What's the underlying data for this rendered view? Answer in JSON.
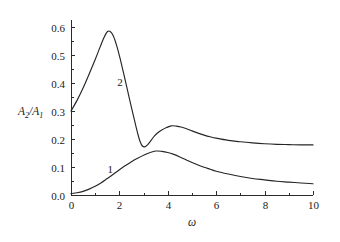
{
  "chart_data": {
    "type": "line",
    "title": "",
    "xlabel": "ω",
    "ylabel": "A2/A1",
    "ylabel_parts": {
      "base1": "A",
      "sub1": "2",
      "slash": "/",
      "base2": "A",
      "sub2": "1"
    },
    "xlim": [
      0,
      10
    ],
    "ylim": [
      0.0,
      0.6
    ],
    "grid": false,
    "legend": "none",
    "x_ticks_major": [
      0,
      2,
      4,
      6,
      8,
      10
    ],
    "x_tick_labels": [
      "0",
      "2",
      "4",
      "6",
      "8",
      "10"
    ],
    "x_ticks_minor": [
      1,
      3,
      5,
      7,
      9
    ],
    "y_ticks_major": [
      0.0,
      0.1,
      0.2,
      0.3,
      0.4,
      0.5,
      0.6
    ],
    "y_tick_labels": [
      "0.0",
      "0.1",
      "0.2",
      "0.3",
      "0.4",
      "0.5",
      "0.6"
    ],
    "y_ticks_minor": [
      0.05,
      0.15,
      0.25,
      0.35,
      0.45,
      0.55
    ],
    "tick_direction": "in",
    "spines": [
      "left",
      "bottom"
    ],
    "annotations": [
      {
        "text": "1",
        "x": 1.62,
        "y": 0.093
      },
      {
        "text": "2",
        "x": 2.02,
        "y": 0.402
      }
    ],
    "series": [
      {
        "name": "1",
        "label": "1",
        "color": "#262626",
        "points": [
          [
            0.0,
            0.005
          ],
          [
            0.25,
            0.008
          ],
          [
            0.5,
            0.013
          ],
          [
            0.75,
            0.021
          ],
          [
            1.0,
            0.031
          ],
          [
            1.25,
            0.044
          ],
          [
            1.5,
            0.059
          ],
          [
            1.75,
            0.074
          ],
          [
            2.0,
            0.09
          ],
          [
            2.25,
            0.105
          ],
          [
            2.5,
            0.119
          ],
          [
            2.75,
            0.131
          ],
          [
            3.0,
            0.142
          ],
          [
            3.25,
            0.151
          ],
          [
            3.5,
            0.157
          ],
          [
            3.75,
            0.156
          ],
          [
            4.0,
            0.152
          ],
          [
            4.25,
            0.145
          ],
          [
            4.5,
            0.136
          ],
          [
            4.75,
            0.126
          ],
          [
            5.0,
            0.116
          ],
          [
            5.25,
            0.107
          ],
          [
            5.5,
            0.099
          ],
          [
            5.75,
            0.092
          ],
          [
            6.0,
            0.085
          ],
          [
            6.5,
            0.075
          ],
          [
            7.0,
            0.066
          ],
          [
            7.5,
            0.059
          ],
          [
            8.0,
            0.054
          ],
          [
            8.5,
            0.049
          ],
          [
            9.0,
            0.046
          ],
          [
            9.5,
            0.043
          ],
          [
            10.0,
            0.04
          ]
        ]
      },
      {
        "name": "2",
        "label": "2",
        "color": "#262626",
        "points": [
          [
            0.0,
            0.3
          ],
          [
            0.25,
            0.338
          ],
          [
            0.5,
            0.382
          ],
          [
            0.75,
            0.432
          ],
          [
            1.0,
            0.484
          ],
          [
            1.2,
            0.528
          ],
          [
            1.35,
            0.56
          ],
          [
            1.5,
            0.583
          ],
          [
            1.62,
            0.584
          ],
          [
            1.75,
            0.568
          ],
          [
            1.9,
            0.53
          ],
          [
            2.05,
            0.48
          ],
          [
            2.2,
            0.425
          ],
          [
            2.35,
            0.368
          ],
          [
            2.5,
            0.312
          ],
          [
            2.62,
            0.268
          ],
          [
            2.75,
            0.222
          ],
          [
            2.85,
            0.192
          ],
          [
            2.95,
            0.175
          ],
          [
            3.05,
            0.172
          ],
          [
            3.15,
            0.178
          ],
          [
            3.3,
            0.194
          ],
          [
            3.45,
            0.211
          ],
          [
            3.6,
            0.223
          ],
          [
            3.75,
            0.232
          ],
          [
            3.95,
            0.241
          ],
          [
            4.15,
            0.247
          ],
          [
            4.35,
            0.246
          ],
          [
            4.55,
            0.243
          ],
          [
            4.8,
            0.236
          ],
          [
            5.0,
            0.229
          ],
          [
            5.25,
            0.221
          ],
          [
            5.5,
            0.214
          ],
          [
            5.75,
            0.208
          ],
          [
            6.0,
            0.203
          ],
          [
            6.5,
            0.195
          ],
          [
            7.0,
            0.19
          ],
          [
            7.5,
            0.186
          ],
          [
            8.0,
            0.183
          ],
          [
            8.5,
            0.181
          ],
          [
            9.0,
            0.18
          ],
          [
            9.5,
            0.179
          ],
          [
            10.0,
            0.179
          ]
        ]
      }
    ]
  },
  "geometry": {
    "x0_px": 71,
    "y0_px": 195,
    "x1_px": 313,
    "y_top_px": 27,
    "tick_major_len": 4,
    "tick_minor_len": 2.5
  }
}
